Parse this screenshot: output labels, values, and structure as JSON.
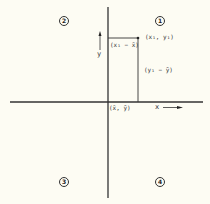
{
  "diagram": {
    "type": "scatter-deviation-quadrants",
    "quadrants": [
      {
        "id": 1,
        "label": "1",
        "position": "upper-right"
      },
      {
        "id": 2,
        "label": "2",
        "position": "upper-left"
      },
      {
        "id": 3,
        "label": "3",
        "position": "lower-left"
      },
      {
        "id": 4,
        "label": "4",
        "position": "lower-right"
      }
    ],
    "axes": {
      "x_label": "x",
      "y_label": "y"
    },
    "labels": {
      "point": "(x₁, y₁)",
      "origin": "(x̄, ȳ)",
      "x_deviation": "(x₁ − x̄)",
      "y_deviation": "(y₁ − ȳ)"
    },
    "colors": {
      "background": "#fdfcf3",
      "ink": "#333333"
    }
  }
}
